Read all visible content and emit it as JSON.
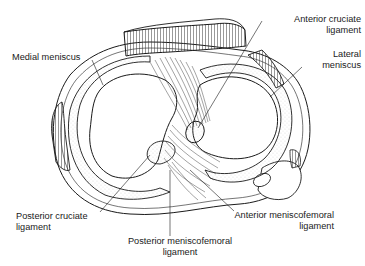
{
  "diagram": {
    "colors": {
      "ink": "#1a1a1a",
      "background": "#ffffff"
    },
    "labels": {
      "medial_meniscus": {
        "line1": "Medial meniscus"
      },
      "anterior_cruciate": {
        "line1": "Anterior cruciate",
        "line2": "ligament"
      },
      "lateral_meniscus": {
        "line1": "Lateral",
        "line2": "meniscus"
      },
      "posterior_cruciate": {
        "line1": "Posterior cruciate",
        "line2": "ligament"
      },
      "posterior_meniscofemoral": {
        "line1": "Posterior meniscofemoral",
        "line2": "ligament"
      },
      "anterior_meniscofemoral": {
        "line1": "Anterior meniscofemoral",
        "line2": "ligament"
      }
    }
  }
}
